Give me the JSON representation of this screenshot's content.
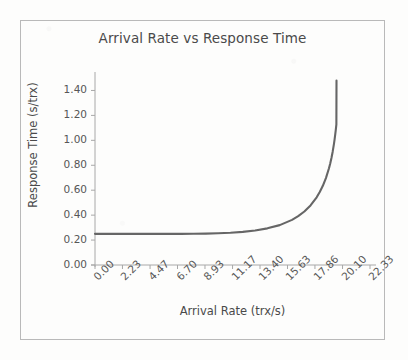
{
  "figure": {
    "background_color": "#fdfdfc",
    "frame_color": "#b9b9b9",
    "text_color": "#4a4a4a",
    "tick_text_color": "#565656",
    "axis_color": "#a8a8a8",
    "curve_color": "#666666"
  },
  "chart_data": {
    "type": "line",
    "title": "Arrival Rate vs Response Time",
    "xlabel": "Arrival Rate (trx/s)",
    "ylabel": "Response Time (s/trx)",
    "xlim": [
      0.0,
      22.33
    ],
    "ylim": [
      0.0,
      1.5
    ],
    "grid": false,
    "legend": null,
    "legend_position": "none",
    "x_tick_labels": [
      "0.00",
      "2.23",
      "4.47",
      "6.70",
      "8.93",
      "11.17",
      "13.40",
      "15.63",
      "17.86",
      "20.10",
      "22.33"
    ],
    "x_tick_values": [
      0.0,
      2.23,
      4.47,
      6.7,
      8.93,
      11.17,
      13.4,
      15.63,
      17.86,
      20.1,
      22.33
    ],
    "y_tick_labels": [
      "0.00",
      "0.20",
      "0.40",
      "0.60",
      "0.80",
      "1.00",
      "1.20",
      "1.40"
    ],
    "y_tick_values": [
      0.0,
      0.2,
      0.4,
      0.6,
      0.8,
      1.0,
      1.2,
      1.4
    ],
    "series": [
      {
        "name": "Response Time",
        "color": "#666666",
        "line_width": 2.1,
        "model": {
          "formula": "R = S / (1 - (lambda / lambda_max)^k)",
          "service_time_s": 0.25,
          "lambda_max": 19.75,
          "k": 8,
          "clip_top": 1.48
        },
        "x": [
          0.0,
          1.0,
          2.0,
          3.0,
          4.0,
          5.0,
          6.0,
          7.0,
          8.0,
          9.0,
          10.0,
          11.0,
          12.0,
          13.0,
          14.0,
          15.0,
          16.0,
          16.5,
          17.0,
          17.5,
          18.0,
          18.25,
          18.5,
          18.75,
          19.0,
          19.1,
          19.2,
          19.3,
          19.4,
          19.45,
          19.5,
          19.55,
          19.6
        ],
        "y": [
          0.25,
          0.25,
          0.25,
          0.25,
          0.25,
          0.25,
          0.25,
          0.25,
          0.251,
          0.252,
          0.255,
          0.259,
          0.266,
          0.277,
          0.294,
          0.32,
          0.362,
          0.392,
          0.429,
          0.478,
          0.543,
          0.585,
          0.635,
          0.697,
          0.776,
          0.814,
          0.858,
          0.909,
          0.969,
          1.003,
          1.041,
          1.082,
          1.128
        ]
      }
    ]
  },
  "geometry": {
    "plot_left": 95,
    "plot_right": 370,
    "plot_bottom": 265,
    "plot_top": 78
  }
}
